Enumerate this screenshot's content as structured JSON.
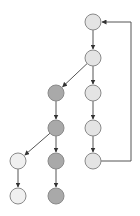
{
  "diagram": {
    "type": "directed-graph",
    "colors": {
      "background": "#ffffff",
      "stroke": "#8a8a8a",
      "edge": "#555555",
      "node_light": "#e4e4e4",
      "node_dark": "#a9a9a9",
      "node_faint": "#f0f0f0"
    },
    "node_radius": 8,
    "nodes": [
      {
        "id": "n1",
        "x": 93,
        "y": 22,
        "shade": "light"
      },
      {
        "id": "n2",
        "x": 93,
        "y": 58,
        "shade": "light"
      },
      {
        "id": "n3",
        "x": 56,
        "y": 93,
        "shade": "dark"
      },
      {
        "id": "n4",
        "x": 93,
        "y": 93,
        "shade": "light"
      },
      {
        "id": "n5",
        "x": 56,
        "y": 128,
        "shade": "dark"
      },
      {
        "id": "n6",
        "x": 93,
        "y": 128,
        "shade": "light"
      },
      {
        "id": "n7",
        "x": 18,
        "y": 161,
        "shade": "faint"
      },
      {
        "id": "n8",
        "x": 56,
        "y": 161,
        "shade": "dark"
      },
      {
        "id": "n9",
        "x": 93,
        "y": 161,
        "shade": "light"
      },
      {
        "id": "n10",
        "x": 18,
        "y": 196,
        "shade": "faint"
      },
      {
        "id": "n11",
        "x": 56,
        "y": 196,
        "shade": "dark"
      }
    ],
    "edges": [
      {
        "from": "n1",
        "to": "n2"
      },
      {
        "from": "n2",
        "to": "n3"
      },
      {
        "from": "n2",
        "to": "n4"
      },
      {
        "from": "n3",
        "to": "n5"
      },
      {
        "from": "n4",
        "to": "n6"
      },
      {
        "from": "n5",
        "to": "n7"
      },
      {
        "from": "n5",
        "to": "n8"
      },
      {
        "from": "n6",
        "to": "n9"
      },
      {
        "from": "n7",
        "to": "n10"
      },
      {
        "from": "n8",
        "to": "n11"
      },
      {
        "from": "n9",
        "to": "n1",
        "route": "feedback-right",
        "route_x": 131
      }
    ]
  }
}
